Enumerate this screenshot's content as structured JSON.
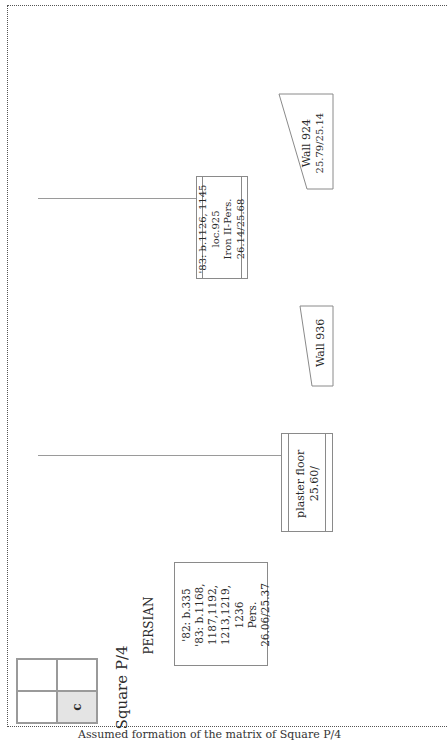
{
  "diagram": {
    "orientation": "rotated-90-ccw",
    "square": {
      "title": "Square P/4",
      "grid_cells": [
        "",
        "",
        "",
        "c"
      ],
      "highlighted_cell": "c",
      "highlight_color": "#e4e4e4"
    },
    "period_label": "PERSIAN",
    "units": [
      {
        "id": "pers-loci",
        "lines": [
          "'82: b.335",
          "'83: b.1168,",
          "1187,1192,",
          "1213,1219,",
          "1236",
          "Pers.",
          "26.06/25.37"
        ]
      },
      {
        "id": "plaster-floor",
        "lines": [
          "plaster floor",
          "25.60/"
        ]
      },
      {
        "id": "wall-936",
        "lines": [
          "Wall 936"
        ]
      },
      {
        "id": "loc-925",
        "lines": [
          "'83: b.1126, 1145",
          "loc.925",
          "Iron II-Pers.",
          "26.14/25.68"
        ]
      },
      {
        "id": "wall-924",
        "lines": [
          "Wall 924",
          "25.79/25.14"
        ]
      }
    ],
    "caption": "Assumed formation of the matrix of Square P/4"
  },
  "colors": {
    "line": "#9a9a9a",
    "border": "#8a8a8a",
    "text": "#2a2a2a"
  }
}
